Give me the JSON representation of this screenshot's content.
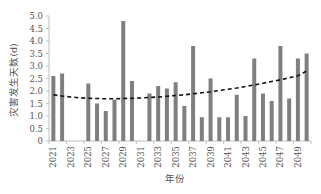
{
  "chart_data": {
    "type": "bar",
    "title": "",
    "xlabel": "年份",
    "ylabel": "灾害发生天数(d)",
    "ylim": [
      0,
      5.0
    ],
    "yticks": [
      "0",
      "0.5",
      "1.0",
      "1.5",
      "2.0",
      "2.5",
      "3.0",
      "3.5",
      "4.0",
      "4.5",
      "5.0"
    ],
    "xtick_labels": [
      "2021",
      "2023",
      "2025",
      "2027",
      "2029",
      "2031",
      "2033",
      "2035",
      "2037",
      "2039",
      "2041",
      "2043",
      "2045",
      "2047",
      "2049"
    ],
    "grid": false,
    "legend": "none",
    "categories": [
      "2021",
      "2022",
      "2023",
      "2024",
      "2025",
      "2026",
      "2027",
      "2028",
      "2029",
      "2030",
      "2031",
      "2032",
      "2033",
      "2034",
      "2035",
      "2036",
      "2037",
      "2038",
      "2039",
      "2040",
      "2041",
      "2042",
      "2043",
      "2044",
      "2045",
      "2046",
      "2047",
      "2048",
      "2049",
      "2050"
    ],
    "series": [
      {
        "name": "灾害发生天数",
        "type": "bar",
        "color": "#7f7f7f",
        "values": [
          2.6,
          2.7,
          0,
          0,
          2.3,
          1.5,
          1.2,
          1.65,
          4.8,
          2.4,
          0,
          1.9,
          2.2,
          2.1,
          2.35,
          1.4,
          3.8,
          0.95,
          2.5,
          0.95,
          0.95,
          1.85,
          1.0,
          3.3,
          1.9,
          1.6,
          3.8,
          1.7,
          3.3,
          3.5
        ]
      },
      {
        "name": "多项式趋势线",
        "type": "line",
        "style": "dashed",
        "color": "#111111",
        "values": [
          1.85,
          1.8,
          1.76,
          1.73,
          1.71,
          1.7,
          1.69,
          1.69,
          1.7,
          1.71,
          1.72,
          1.74,
          1.76,
          1.79,
          1.82,
          1.85,
          1.89,
          1.93,
          1.97,
          2.02,
          2.07,
          2.12,
          2.18,
          2.24,
          2.31,
          2.38,
          2.45,
          2.53,
          2.61,
          2.8
        ]
      }
    ]
  }
}
